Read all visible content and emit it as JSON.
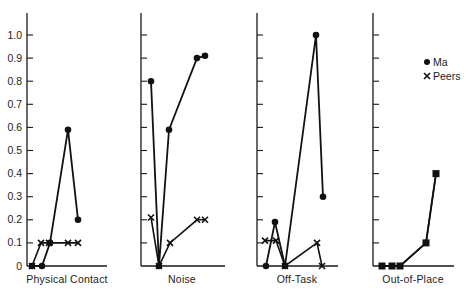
{
  "chart_data": {
    "type": "line",
    "title": "",
    "ylabel": "",
    "ylim": [
      0,
      1.0
    ],
    "yticks": [
      "0",
      "0.1",
      "0.2",
      "0.3",
      "0.4",
      "0.5",
      "0.6",
      "0.7",
      "0.8",
      "0.9",
      "1.0"
    ],
    "legend": {
      "position": "right",
      "entries": [
        {
          "name": "Ma",
          "marker": "dot"
        },
        {
          "name": "Peers",
          "marker": "x"
        }
      ]
    },
    "panels": [
      {
        "label": "Physical Contact",
        "series": [
          {
            "name": "Ma",
            "values": [
              0,
              0,
              0.1,
              0.59,
              0.2
            ]
          },
          {
            "name": "Peers",
            "values": [
              0,
              0.1,
              0.1,
              0.1,
              0.1
            ]
          }
        ]
      },
      {
        "label": "Noise",
        "series": [
          {
            "name": "Ma",
            "values": [
              0.8,
              0,
              0.59,
              0.9,
              0.91
            ]
          },
          {
            "name": "Peers",
            "values": [
              0.21,
              0,
              0.1,
              0.2,
              0.2
            ]
          }
        ]
      },
      {
        "label": "Off-Task",
        "series": [
          {
            "name": "Ma",
            "values": [
              0,
              0.19,
              0,
              1.0,
              0.3
            ]
          },
          {
            "name": "Peers",
            "values": [
              0.11,
              0.11,
              0,
              0.1,
              0
            ]
          }
        ]
      },
      {
        "label": "Out-of-Place",
        "overlap": true,
        "series": [
          {
            "name": "Ma",
            "values": [
              0,
              0,
              0,
              0.1,
              0.4
            ]
          },
          {
            "name": "Peers",
            "values": [
              0,
              0,
              0,
              0.1,
              0.4
            ]
          }
        ]
      }
    ]
  }
}
